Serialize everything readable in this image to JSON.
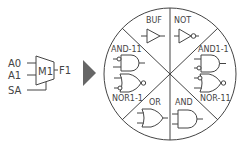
{
  "mux": {
    "name": "M1",
    "inputs": [
      "A0",
      "A1"
    ],
    "select": "SA",
    "output": "F1"
  },
  "arrow": {
    "icon": "right-triangle-arrow",
    "color": "#666666"
  },
  "wheel": {
    "sectors": [
      {
        "label": "BUF",
        "gate": "buffer"
      },
      {
        "label": "NOT",
        "gate": "not"
      },
      {
        "label": "AND1-1",
        "gate": "and-inverted-input-2"
      },
      {
        "label": "NOR-11",
        "gate": "nor-inverted-input-1"
      },
      {
        "label": "AND",
        "gate": "and"
      },
      {
        "label": "OR",
        "gate": "or"
      },
      {
        "label": "NOR1-1",
        "gate": "nor-inverted-input-2"
      },
      {
        "label": "AND-11",
        "gate": "and-inverted-input-1"
      }
    ]
  },
  "colors": {
    "stroke": "#444444",
    "arrow": "#666666"
  }
}
